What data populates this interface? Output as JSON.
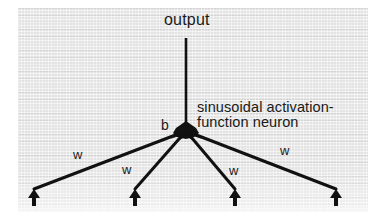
{
  "figure": {
    "background_color": "#ffffff",
    "panel_color": "#e3e3e3",
    "ink_color": "#111111"
  },
  "labels": {
    "output": "output",
    "bias": "b",
    "neuron_caption_line1": "sinusoidal activation-",
    "neuron_caption_line2": "function neuron"
  },
  "weights": [
    {
      "label": "w"
    },
    {
      "label": "w"
    },
    {
      "label": "w"
    },
    {
      "label": "w"
    }
  ],
  "icons": {
    "neuron_node": "filled-node-icon",
    "input_arrow": "arrow-up-icon",
    "output_line": "line-icon"
  },
  "graph": {
    "node": {
      "x": 186,
      "y": 131
    },
    "output_line": {
      "x1": 186,
      "y1": 38,
      "x2": 186,
      "y2": 131
    },
    "inputs": [
      {
        "x": 34,
        "y": 190,
        "edge": {
          "x1": 186,
          "y1": 131,
          "x2": 34,
          "y2": 190
        }
      },
      {
        "x": 135,
        "y": 190,
        "edge": {
          "x1": 186,
          "y1": 131,
          "x2": 135,
          "y2": 190
        }
      },
      {
        "x": 235,
        "y": 190,
        "edge": {
          "x1": 186,
          "y1": 131,
          "x2": 235,
          "y2": 190
        }
      },
      {
        "x": 336,
        "y": 190,
        "edge": {
          "x1": 186,
          "y1": 131,
          "x2": 336,
          "y2": 190
        }
      }
    ]
  }
}
